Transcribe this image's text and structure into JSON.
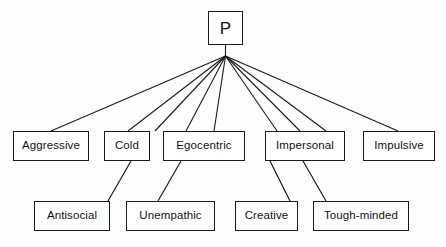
{
  "diagram": {
    "type": "hierarchy-tree",
    "title": "",
    "style": {
      "box_border_color": "#1a1a1a",
      "box_fill_color": "#ffffff",
      "line_color": "#1a1a1a",
      "background_color": "#fdfdfd",
      "text_color": "#111111"
    },
    "root": {
      "id": "p",
      "label": "P",
      "x": 208,
      "y": 11,
      "width": 35,
      "height": 34
    },
    "apex": {
      "x": 225.5,
      "y": 56
    },
    "level_one": [
      {
        "id": "aggressive",
        "label": "Aggressive",
        "x": 13,
        "y": 131,
        "width": 76,
        "height": 30
      },
      {
        "id": "cold",
        "label": "Cold",
        "x": 104,
        "y": 131,
        "width": 46,
        "height": 30
      },
      {
        "id": "egocentric",
        "label": "Egocentric",
        "x": 163,
        "y": 131,
        "width": 82,
        "height": 30
      },
      {
        "id": "impersonal",
        "label": "Impersonal",
        "x": 265,
        "y": 131,
        "width": 80,
        "height": 30
      },
      {
        "id": "impulsive",
        "label": "Impulsive",
        "x": 363,
        "y": 131,
        "width": 72,
        "height": 30
      }
    ],
    "level_two": [
      {
        "id": "antisocial",
        "label": "Antisocial",
        "x": 34,
        "y": 201,
        "width": 76,
        "height": 30
      },
      {
        "id": "unempathic",
        "label": "Unempathic",
        "x": 126,
        "y": 201,
        "width": 89,
        "height": 30
      },
      {
        "id": "creative",
        "label": "Creative",
        "x": 235,
        "y": 201,
        "width": 63,
        "height": 30
      },
      {
        "id": "tough-minded",
        "label": "Tough-minded",
        "x": 313,
        "y": 201,
        "width": 96,
        "height": 30
      }
    ],
    "edges_from_apex": [
      {
        "id": "edge-apex-aggressive",
        "target": "aggressive",
        "x2": 51,
        "y2": 131
      },
      {
        "id": "edge-apex-cold",
        "target": "cold",
        "x2": 128,
        "y2": 131
      },
      {
        "id": "edge-apex-antisocial",
        "target": "antisocial",
        "x2": 155,
        "y2": 131
      },
      {
        "id": "edge-apex-egocentric",
        "target": "egocentric",
        "x2": 186,
        "y2": 131
      },
      {
        "id": "edge-apex-unempathic",
        "target": "unempathic",
        "x2": 214,
        "y2": 131
      },
      {
        "id": "edge-apex-impersonal-a",
        "target": "impersonal",
        "x2": 277,
        "y2": 131
      },
      {
        "id": "edge-apex-impersonal-b",
        "target": "impersonal",
        "x2": 300,
        "y2": 131
      },
      {
        "id": "edge-apex-toughminded",
        "target": "tough-minded",
        "x2": 326,
        "y2": 131
      },
      {
        "id": "edge-apex-impulsive",
        "target": "impulsive",
        "x2": 398,
        "y2": 131
      }
    ],
    "edges_level_one_to_two": [
      {
        "id": "edge-cold-antisocial",
        "x1": 131,
        "y1": 161,
        "x2": 108,
        "y2": 201
      },
      {
        "id": "edge-egocentric-unempathic",
        "x1": 181,
        "y1": 161,
        "x2": 158,
        "y2": 201
      },
      {
        "id": "edge-impersonal-creative",
        "x1": 270,
        "y1": 161,
        "x2": 290,
        "y2": 201
      },
      {
        "id": "edge-impersonal-toughminded",
        "x1": 303,
        "y1": 161,
        "x2": 326,
        "y2": 201
      }
    ]
  }
}
